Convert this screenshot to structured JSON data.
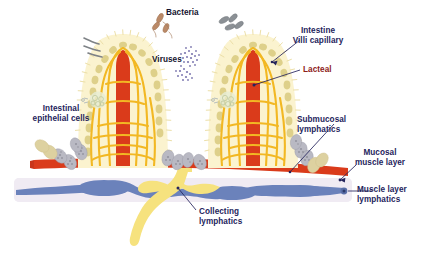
{
  "figure": {
    "type": "biomedical-illustration",
    "width": 424,
    "height": 253,
    "background_color": "#ffffff"
  },
  "labels": {
    "bacteria": "Bacteria",
    "viruses": "Viruses",
    "intestine_villi_capillary_line1": "Intestine",
    "intestine_villi_capillary_line2": "Villi capillary",
    "lacteal": "Lacteal",
    "intestinal_epithelial_cells_line1": "Intestinal",
    "intestinal_epithelial_cells_line2": "epithelial cells",
    "submucosal_lymphatics_line1": "Submucosal",
    "submucosal_lymphatics_line2": "lymphatics",
    "mucosal_muscle_layer_line1": "Mucosal",
    "mucosal_muscle_layer_line2": "muscle layer",
    "muscle_layer_lymphatics_line1": "Muscle layer",
    "muscle_layer_lymphatics_line2": "lymphatics",
    "collecting_lymphatics_line1": "Collecting",
    "collecting_lymphatics_line2": "lymphatics"
  },
  "colors": {
    "label_navy": "#25245c",
    "label_dark": "#14132e",
    "label_maroon": "#8d2118",
    "capillary_red": "#da3b1b",
    "lacteal_yellow": "#f2b823",
    "epithelium_cream": "#fbf3cf",
    "epithelial_cell_yellow": "#ded08a",
    "goblet_cell_gray": "#a9a9b4",
    "lymph_vessel_blue": "#6b82bb",
    "muscle_band_lavender": "#ece7f1",
    "collecting_lymph_yellow": "#f6e27e",
    "bacteria_gray": "#7e8286",
    "bacteria_brown": "#b98a6a",
    "virus_purple": "#6f6aa8"
  },
  "structures": [
    {
      "name": "villus-left",
      "description": "Left intestinal villus with central red capillary and yellow lacteal network"
    },
    {
      "name": "villus-right",
      "description": "Right intestinal villus with central red capillary and yellow lacteal network"
    },
    {
      "name": "submucosal-vessel",
      "description": "Horizontal red submucosal blood vessel"
    },
    {
      "name": "mucosal-muscle-band",
      "description": "Pale lavender horizontal muscle layer band"
    },
    {
      "name": "muscle-layer-lymphatic",
      "description": "Blue horizontal lymphatic vessel within muscle layer"
    },
    {
      "name": "collecting-lymphatic",
      "description": "Pale yellow branching collecting lymphatic vessel"
    },
    {
      "name": "bacteria-cluster-left",
      "description": "Brown rod bacteria above left villus"
    },
    {
      "name": "bacteria-cluster-right",
      "description": "Gray rod bacteria above right villus"
    },
    {
      "name": "virus-cluster",
      "description": "Purple stippled virus particles between villi"
    }
  ]
}
